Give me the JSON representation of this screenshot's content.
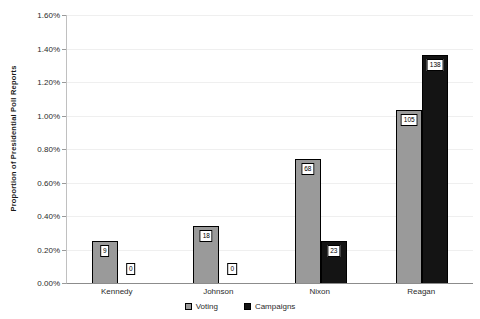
{
  "chart_data": {
    "type": "bar",
    "title": "",
    "xlabel": "",
    "ylabel": "Proportion of Presidential Poll Reports",
    "categories": [
      "Kennedy",
      "Johnson",
      "Nixon",
      "Reagan"
    ],
    "series": [
      {
        "name": "Voting",
        "color": "#9a9a9a",
        "values_pct": [
          0.25,
          0.34,
          0.74,
          1.03
        ],
        "count_labels": [
          "9",
          "18",
          "68",
          "105"
        ]
      },
      {
        "name": "Campaigns",
        "color": "#141414",
        "values_pct": [
          0,
          0,
          0.25,
          1.36
        ],
        "count_labels": [
          "0",
          "0",
          "23",
          "138"
        ]
      }
    ],
    "y_axis": {
      "min": 0,
      "max": 1.6,
      "step": 0.2,
      "ticks": [
        "1.60%",
        "1.40%",
        "1.20%",
        "1.00%",
        "0.80%",
        "0.60%",
        "0.40%",
        "0.20%",
        "0.00%"
      ]
    },
    "legend": {
      "position": "bottom",
      "entries": [
        "Voting",
        "Campaigns"
      ]
    },
    "grid": true,
    "background_color": "#ffffff",
    "label_box": {
      "background": "#ffffff",
      "border": "#000000"
    }
  }
}
